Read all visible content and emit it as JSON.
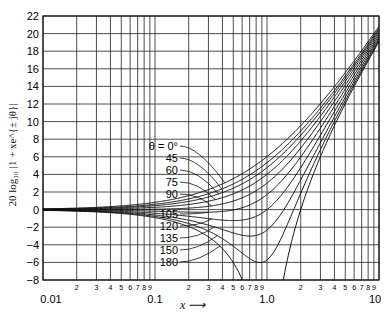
{
  "chart_data": {
    "type": "line",
    "title": "",
    "xlabel": "x",
    "ylabel": "20 log10 |1 + x e^{±jθ}|",
    "xscale": "log",
    "xlim": [
      0.01,
      10
    ],
    "ylim": [
      -8,
      22
    ],
    "grid": true,
    "y_ticks": [
      -8,
      -6,
      -4,
      -2,
      0,
      2,
      4,
      6,
      8,
      10,
      12,
      14,
      16,
      18,
      20,
      22
    ],
    "x_major_tick_labels": [
      "0.01",
      "0.1",
      "1.0",
      "10"
    ],
    "x_minor_tick_labels": [
      "2",
      "3",
      "4",
      "5",
      "6",
      "7",
      "8",
      "9"
    ],
    "legend": "θ labels with arrows to curves",
    "formula": "10*log10(1 + 2*x*cos(θ) + x^2)",
    "series": [
      {
        "name": "θ = 0°",
        "theta": 0
      },
      {
        "name": "45",
        "theta": 45
      },
      {
        "name": "60",
        "theta": 60
      },
      {
        "name": "75",
        "theta": 75
      },
      {
        "name": "90",
        "theta": 90
      },
      {
        "name": "105",
        "theta": 105
      },
      {
        "name": "120",
        "theta": 120
      },
      {
        "name": "135",
        "theta": 135
      },
      {
        "name": "150",
        "theta": 150
      },
      {
        "name": "180",
        "theta": 180
      }
    ],
    "sample_points": {
      "x": [
        0.01,
        0.1,
        0.3,
        0.5,
        1.0,
        2.0,
        5.0,
        10.0
      ],
      "theta_0": [
        0.09,
        0.83,
        2.28,
        3.52,
        6.02,
        9.54,
        15.56,
        20.83
      ],
      "theta_90": [
        0.0,
        0.04,
        0.37,
        0.97,
        3.01,
        6.99,
        14.15,
        20.04
      ],
      "theta_180": [
        -0.09,
        -0.92,
        -3.1,
        -6.02,
        null,
        0.0,
        12.04,
        19.08
      ]
    }
  },
  "axes": {
    "x_axis_label": "x",
    "y_axis_label": "20 log₁₀ |1 + xe^{± jθ}|"
  },
  "annotations": {
    "upper_labels": [
      "θ = 0°",
      "45",
      "60",
      "75",
      "90"
    ],
    "lower_labels": [
      "105",
      "120",
      "135",
      "150",
      "180"
    ]
  }
}
